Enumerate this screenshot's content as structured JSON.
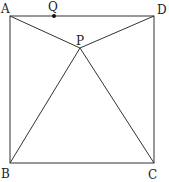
{
  "diagram": {
    "stroke_color": "#333333",
    "points": {
      "A": {
        "label": "A",
        "x": 10,
        "y": 16
      },
      "D": {
        "label": "D",
        "x": 154,
        "y": 16
      },
      "B": {
        "label": "B",
        "x": 10,
        "y": 163
      },
      "C": {
        "label": "C",
        "x": 154,
        "y": 163
      },
      "P": {
        "label": "P",
        "x": 80,
        "y": 48
      },
      "Q": {
        "label": "Q",
        "x": 54,
        "y": 16
      }
    },
    "segments": [
      "AD",
      "DC",
      "CB",
      "BA",
      "AP",
      "DP",
      "BP",
      "CP"
    ]
  }
}
